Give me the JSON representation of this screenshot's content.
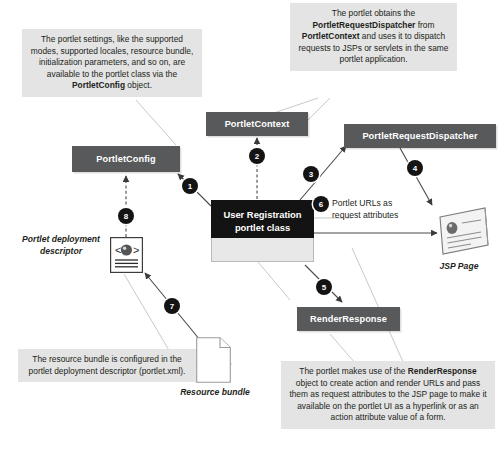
{
  "diagram": {
    "notes": {
      "portletconfig_note": {
        "segments": [
          {
            "text": "The portlet settings, like the supported modes, supported locales, resource bundle, initialization parameters, and so on, are available to the portlet class via the ",
            "bold": false
          },
          {
            "text": "PortletConfig",
            "bold": true
          },
          {
            "text": " object.",
            "bold": false
          }
        ]
      },
      "dispatcher_note": {
        "segments": [
          {
            "text": "The portlet obtains the ",
            "bold": false
          },
          {
            "text": "PortletRequestDispatcher",
            "bold": true
          },
          {
            "text": " from ",
            "bold": false
          },
          {
            "text": "PortletContext",
            "bold": true
          },
          {
            "text": " and uses it to dispatch requests to JSPs or servlets in the same portlet application.",
            "bold": false
          }
        ]
      },
      "resourcebundle_note": {
        "segments": [
          {
            "text": "The resource bundle is configured in the portlet deployment descriptor (portlet.xml).",
            "bold": false
          }
        ]
      },
      "renderresponse_note": {
        "segments": [
          {
            "text": "The portlet makes use of the ",
            "bold": false
          },
          {
            "text": "RenderResponse",
            "bold": true
          },
          {
            "text": " object to create action and render URLs and pass them as request attributes to the JSP page to make it available on the portlet UI as a hyperlink or as an action attribute value of a form.",
            "bold": false
          }
        ]
      }
    },
    "components": {
      "portlet_config": "PortletConfig",
      "portlet_context": "PortletContext",
      "portlet_request_dispatcher": "PortletRequestDispatcher",
      "render_response": "RenderResponse",
      "portlet_class_line1": "User Registration",
      "portlet_class_line2": "portlet class"
    },
    "labels": {
      "deployment_descriptor_line1": "Portlet deployment",
      "deployment_descriptor_line2": "descriptor",
      "resource_bundle": "Resource bundle",
      "jsp_page": "JSP Page",
      "portlet_urls_line1": "Portlet URLs as",
      "portlet_urls_line2": "request attributes"
    },
    "badges": [
      {
        "id": "1",
        "number": "1"
      },
      {
        "id": "2",
        "number": "2"
      },
      {
        "id": "3",
        "number": "3"
      },
      {
        "id": "4",
        "number": "4"
      },
      {
        "id": "5",
        "number": "5"
      },
      {
        "id": "6",
        "number": "6"
      },
      {
        "id": "7",
        "number": "7"
      },
      {
        "id": "8",
        "number": "8"
      }
    ],
    "colors": {
      "note_bg": "#e4e4e4",
      "bar_bg": "#58595b",
      "portlet_header_bg": "#131313",
      "portlet_body_bg": "#e8e8e8",
      "badge_bg": "#141414",
      "text": "#231f20",
      "leader_line": "#c9c9c9",
      "arrow": "#3a3a3a"
    }
  }
}
